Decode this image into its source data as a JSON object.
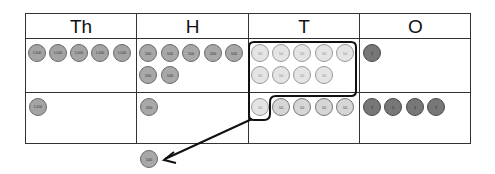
{
  "headers": [
    "Th",
    "H",
    "T",
    "O"
  ],
  "disk_labels": {
    "thousand": "1,000",
    "hundred": "100",
    "ten": "10",
    "one": "1"
  },
  "rows": [
    {
      "Th": 5,
      "H": 7,
      "T": 9,
      "O": 1
    },
    {
      "Th": 1,
      "H": 1,
      "T": 5,
      "O": 4
    }
  ],
  "grouped_tens": 10,
  "regrouped_result": {
    "label": "100",
    "note": "ten 10s regrouped into one 100 disk"
  },
  "colors": {
    "line": "#333333",
    "thousand": "#a4a4a4",
    "hundred": "#a8a8a8",
    "ten": "#e4e4e4",
    "one": "#777777"
  }
}
